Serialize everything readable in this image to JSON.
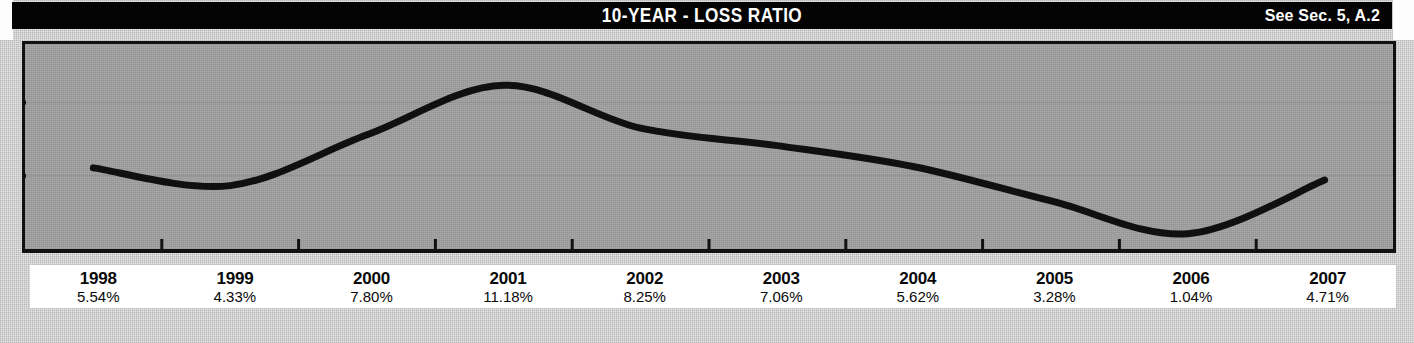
{
  "header": {
    "title": "10-YEAR - LOSS RATIO",
    "note": "See Sec. 5, A.2"
  },
  "colors": {
    "header_bg": "#040404",
    "header_text": "#ffffff",
    "plot_bg": "#a9a9a9",
    "plot_border": "#111111",
    "line": "#101010",
    "gridline": "#8f8f8f",
    "label_bg": "#ffffff",
    "page_bg": "#e6e6e6"
  },
  "chart_data": {
    "type": "line",
    "title": "10-YEAR - LOSS RATIO",
    "xlabel": "",
    "ylabel": "",
    "grid": true,
    "legend": "none",
    "categories": [
      "1998",
      "1999",
      "2000",
      "2001",
      "2002",
      "2003",
      "2004",
      "2005",
      "2006",
      "2007"
    ],
    "values": [
      5.54,
      4.33,
      7.8,
      11.18,
      8.25,
      7.06,
      5.62,
      3.28,
      1.04,
      4.71
    ],
    "value_labels": [
      "5.54%",
      "4.33%",
      "7.80%",
      "11.18%",
      "8.25%",
      "7.06%",
      "5.62%",
      "3.28%",
      "1.04%",
      "4.71%"
    ],
    "ylim": [
      0,
      14
    ],
    "gridline_values": [
      10,
      5
    ],
    "tick_values": [
      10,
      5
    ]
  },
  "labels": [
    {
      "year": "1998",
      "pct": "5.54%"
    },
    {
      "year": "1999",
      "pct": "4.33%"
    },
    {
      "year": "2000",
      "pct": "7.80%"
    },
    {
      "year": "2001",
      "pct": "11.18%"
    },
    {
      "year": "2002",
      "pct": "8.25%"
    },
    {
      "year": "2003",
      "pct": "7.06%"
    },
    {
      "year": "2004",
      "pct": "5.62%"
    },
    {
      "year": "2005",
      "pct": "3.28%"
    },
    {
      "year": "2006",
      "pct": "1.04%"
    },
    {
      "year": "2007",
      "pct": "4.71%"
    }
  ]
}
